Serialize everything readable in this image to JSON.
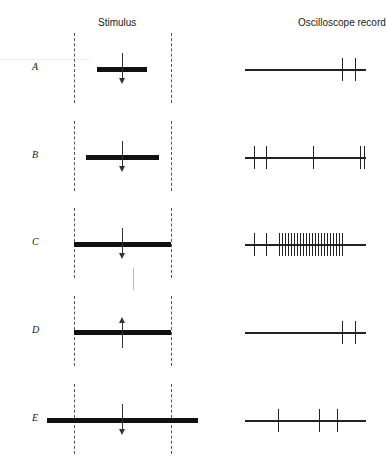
{
  "headers": {
    "stimulus": "Stimulus",
    "oscilloscope": "Oscilloscope record"
  },
  "field_bounds": {
    "left_x": 74,
    "right_x": 171
  },
  "rows": [
    {
      "label": "A",
      "y": 69,
      "bar": {
        "x1": 97,
        "x2": 147
      },
      "arrow": "down",
      "scope": {
        "x1": 245,
        "x2": 366,
        "spikes": [
          342,
          355
        ]
      }
    },
    {
      "label": "B",
      "y": 157,
      "bar": {
        "x1": 86,
        "x2": 159
      },
      "arrow": "down",
      "scope": {
        "x1": 245,
        "x2": 366,
        "spikes": [
          254,
          266,
          313,
          360,
          364
        ]
      }
    },
    {
      "label": "C",
      "y": 244,
      "bar": {
        "x1": 74,
        "x2": 171
      },
      "arrow": "down",
      "scope": {
        "x1": 245,
        "x2": 366,
        "spikes": [
          254,
          266,
          279,
          282,
          285,
          288,
          291,
          294,
          297,
          300,
          303,
          306,
          309,
          312,
          315,
          318,
          321,
          324,
          327,
          330,
          333,
          336,
          339,
          342
        ]
      }
    },
    {
      "label": "D",
      "y": 332,
      "bar": {
        "x1": 74,
        "x2": 171
      },
      "arrow": "up",
      "scope": {
        "x1": 245,
        "x2": 366,
        "spikes": [
          342,
          355
        ]
      }
    },
    {
      "label": "E",
      "y": 420,
      "bar": {
        "x1": 47,
        "x2": 198
      },
      "arrow": "down",
      "scope": {
        "x1": 245,
        "x2": 366,
        "spikes": [
          278,
          319,
          337
        ]
      }
    }
  ],
  "colors": {
    "ink": "#111111",
    "dash": "#555555",
    "background": "#ffffff"
  }
}
